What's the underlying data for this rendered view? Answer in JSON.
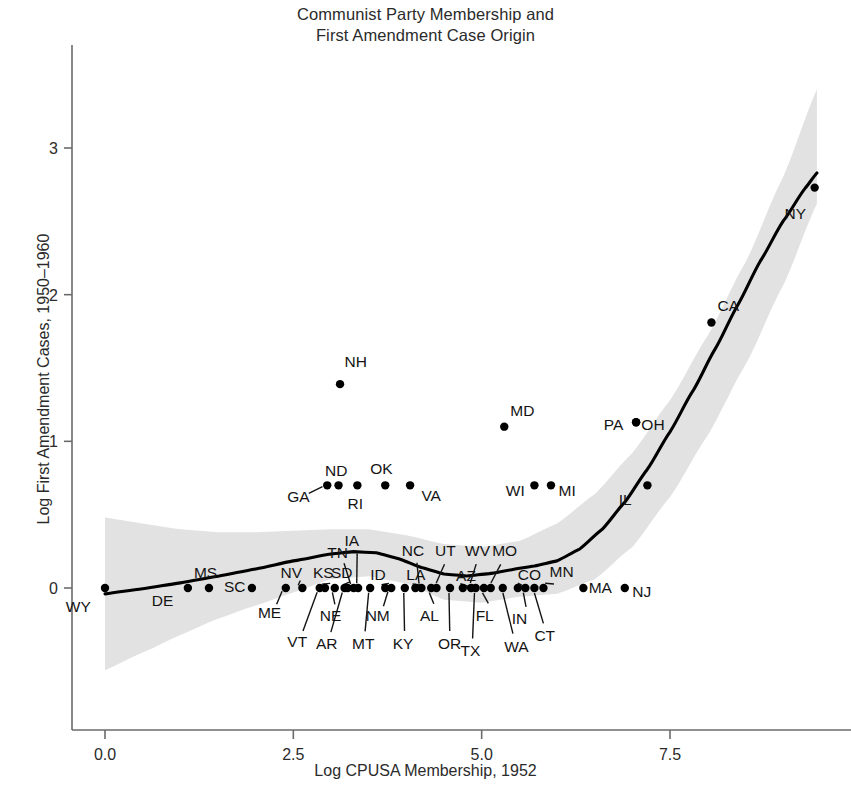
{
  "title": {
    "line1": "Communist Party Membership and",
    "line2": "First Amendment Case Origin"
  },
  "axes": {
    "x_label": "Log CPUSA Membership, 1952",
    "y_label": "Log First Amendment Cases, 1950–1960",
    "x_ticks": [
      "0.0",
      "2.5",
      "5.0",
      "7.5"
    ],
    "y_ticks": [
      "0",
      "1",
      "2",
      "3"
    ]
  },
  "colors": {
    "line": "#000000",
    "band": "#e2e2e2",
    "point": "#000000",
    "axis": "#6b6b6b",
    "text": "#2b2b2b"
  },
  "chart_data": {
    "type": "scatter",
    "title": "Communist Party Membership and First Amendment Case Origin",
    "xlabel": "Log CPUSA Membership, 1952",
    "ylabel": "Log First Amendment Cases, 1950–1960",
    "xlim": [
      -0.45,
      9.9
    ],
    "ylim": [
      -0.55,
      3.5
    ],
    "x_ticks": [
      0.0,
      2.5,
      5.0,
      7.5
    ],
    "y_ticks": [
      0,
      1,
      2,
      3
    ],
    "grid": false,
    "legend": "none",
    "point_label_field": "state",
    "annotations": [
      "LOESS smoother with shaded 95% confidence band"
    ],
    "points": [
      {
        "state": "WY",
        "x": 0.0,
        "y": 0.0,
        "lx": -0.52,
        "ly": -0.13,
        "anchor": "start"
      },
      {
        "state": "DE",
        "x": 1.1,
        "y": 0.0,
        "lx": 0.62,
        "ly": -0.09,
        "anchor": "start"
      },
      {
        "state": "MS",
        "x": 1.38,
        "y": 0.0,
        "lx": 1.18,
        "ly": 0.1,
        "anchor": "start"
      },
      {
        "state": "SC",
        "x": 1.95,
        "y": 0.0,
        "lx": 1.58,
        "ly": 0.01,
        "anchor": "start"
      },
      {
        "state": "ME",
        "x": 2.4,
        "y": 0.0,
        "lx": 2.03,
        "ly": -0.17,
        "anchor": "start",
        "leader": true
      },
      {
        "state": "NV",
        "x": 2.62,
        "y": 0.0,
        "lx": 2.33,
        "ly": 0.1,
        "anchor": "start",
        "leader": true
      },
      {
        "state": "VT",
        "x": 2.85,
        "y": 0.0,
        "lx": 2.42,
        "ly": -0.37,
        "anchor": "start",
        "leader": true
      },
      {
        "state": "KS",
        "x": 2.92,
        "y": 0.0,
        "lx": 2.76,
        "ly": 0.1,
        "anchor": "start",
        "leader": true
      },
      {
        "state": "NE",
        "x": 3.05,
        "y": 0.0,
        "lx": 2.85,
        "ly": -0.19,
        "anchor": "start",
        "leader": true
      },
      {
        "state": "AR",
        "x": 3.18,
        "y": 0.0,
        "lx": 2.8,
        "ly": -0.38,
        "anchor": "start",
        "leader": true
      },
      {
        "state": "SD",
        "x": 3.22,
        "y": 0.0,
        "lx": 3.0,
        "ly": 0.1,
        "anchor": "start",
        "leader": true
      },
      {
        "state": "TN",
        "x": 3.3,
        "y": 0.0,
        "lx": 2.95,
        "ly": 0.24,
        "anchor": "start",
        "leader": true
      },
      {
        "state": "IA",
        "x": 3.36,
        "y": 0.0,
        "lx": 3.18,
        "ly": 0.32,
        "anchor": "start",
        "leader": true
      },
      {
        "state": "MT",
        "x": 3.52,
        "y": 0.0,
        "lx": 3.28,
        "ly": -0.38,
        "anchor": "start",
        "leader": true
      },
      {
        "state": "ID",
        "x": 3.72,
        "y": 0.0,
        "lx": 3.52,
        "ly": 0.09,
        "anchor": "start",
        "leader": true
      },
      {
        "state": "NM",
        "x": 3.8,
        "y": 0.0,
        "lx": 3.46,
        "ly": -0.19,
        "anchor": "start",
        "leader": true
      },
      {
        "state": "KY",
        "x": 3.98,
        "y": 0.0,
        "lx": 3.82,
        "ly": -0.38,
        "anchor": "start",
        "leader": true
      },
      {
        "state": "LA",
        "x": 4.12,
        "y": 0.0,
        "lx": 4.0,
        "ly": 0.09,
        "anchor": "start",
        "leader": true
      },
      {
        "state": "NC",
        "x": 4.2,
        "y": 0.0,
        "lx": 3.94,
        "ly": 0.25,
        "anchor": "start",
        "leader": true
      },
      {
        "state": "AL",
        "x": 4.33,
        "y": 0.0,
        "lx": 4.18,
        "ly": -0.19,
        "anchor": "start",
        "leader": true
      },
      {
        "state": "UT",
        "x": 4.4,
        "y": 0.0,
        "lx": 4.38,
        "ly": 0.25,
        "anchor": "start",
        "leader": true
      },
      {
        "state": "OR",
        "x": 4.58,
        "y": 0.0,
        "lx": 4.42,
        "ly": -0.38,
        "anchor": "start",
        "leader": true
      },
      {
        "state": "AZ",
        "x": 4.75,
        "y": 0.0,
        "lx": 4.66,
        "ly": 0.08,
        "anchor": "start",
        "leader": true
      },
      {
        "state": "WV",
        "x": 4.86,
        "y": 0.0,
        "lx": 4.78,
        "ly": 0.25,
        "anchor": "start",
        "leader": true
      },
      {
        "state": "TX",
        "x": 4.92,
        "y": 0.0,
        "lx": 4.72,
        "ly": -0.43,
        "anchor": "start",
        "leader": true
      },
      {
        "state": "FL",
        "x": 5.03,
        "y": 0.0,
        "lx": 4.92,
        "ly": -0.19,
        "anchor": "start",
        "leader": true
      },
      {
        "state": "MO",
        "x": 5.12,
        "y": 0.0,
        "lx": 5.14,
        "ly": 0.25,
        "anchor": "start",
        "leader": true
      },
      {
        "state": "WA",
        "x": 5.28,
        "y": 0.0,
        "lx": 5.3,
        "ly": -0.4,
        "anchor": "start",
        "leader": true
      },
      {
        "state": "CO",
        "x": 5.48,
        "y": 0.0,
        "lx": 5.48,
        "ly": 0.09,
        "anchor": "start",
        "leader": true
      },
      {
        "state": "IN",
        "x": 5.58,
        "y": 0.0,
        "lx": 5.4,
        "ly": -0.21,
        "anchor": "start",
        "leader": true
      },
      {
        "state": "CT",
        "x": 5.7,
        "y": 0.0,
        "lx": 5.7,
        "ly": -0.33,
        "anchor": "start",
        "leader": true
      },
      {
        "state": "MN",
        "x": 5.82,
        "y": 0.0,
        "lx": 5.9,
        "ly": 0.11,
        "anchor": "start",
        "leader": true
      },
      {
        "state": "MA",
        "x": 6.35,
        "y": 0.0,
        "lx": 6.42,
        "ly": 0.0,
        "anchor": "start"
      },
      {
        "state": "NJ",
        "x": 6.9,
        "y": 0.0,
        "lx": 7.0,
        "ly": -0.03,
        "anchor": "start"
      },
      {
        "state": "GA",
        "x": 2.95,
        "y": 0.7,
        "lx": 2.42,
        "ly": 0.62,
        "anchor": "start",
        "leader": true
      },
      {
        "state": "ND",
        "x": 3.1,
        "y": 0.7,
        "lx": 2.92,
        "ly": 0.8,
        "anchor": "start"
      },
      {
        "state": "RI",
        "x": 3.35,
        "y": 0.7,
        "lx": 3.22,
        "ly": 0.57,
        "anchor": "start"
      },
      {
        "state": "OK",
        "x": 3.72,
        "y": 0.7,
        "lx": 3.52,
        "ly": 0.81,
        "anchor": "start"
      },
      {
        "state": "VA",
        "x": 4.05,
        "y": 0.7,
        "lx": 4.2,
        "ly": 0.63,
        "anchor": "start"
      },
      {
        "state": "WI",
        "x": 5.7,
        "y": 0.7,
        "lx": 5.32,
        "ly": 0.66,
        "anchor": "start"
      },
      {
        "state": "MI",
        "x": 5.92,
        "y": 0.7,
        "lx": 6.02,
        "ly": 0.66,
        "anchor": "start"
      },
      {
        "state": "IL",
        "x": 7.2,
        "y": 0.7,
        "lx": 6.82,
        "ly": 0.6,
        "anchor": "start"
      },
      {
        "state": "MD",
        "x": 5.3,
        "y": 1.1,
        "lx": 5.38,
        "ly": 1.21,
        "anchor": "start"
      },
      {
        "state": "PA",
        "x": 7.05,
        "y": 1.13,
        "lx": 6.62,
        "ly": 1.11,
        "anchor": "start"
      },
      {
        "state": "OH",
        "x": 7.05,
        "y": 1.13,
        "lx": 7.12,
        "ly": 1.11,
        "anchor": "start"
      },
      {
        "state": "NH",
        "x": 3.12,
        "y": 1.39,
        "lx": 3.18,
        "ly": 1.54,
        "anchor": "start"
      },
      {
        "state": "CA",
        "x": 8.05,
        "y": 1.81,
        "lx": 8.13,
        "ly": 1.92,
        "anchor": "start"
      },
      {
        "state": "NY",
        "x": 9.42,
        "y": 2.73,
        "lx": 9.02,
        "ly": 2.55,
        "anchor": "start"
      }
    ],
    "fit_line": [
      {
        "x": 0.0,
        "y": -0.04
      },
      {
        "x": 0.5,
        "y": -0.005
      },
      {
        "x": 1.0,
        "y": 0.035
      },
      {
        "x": 1.5,
        "y": 0.08
      },
      {
        "x": 2.0,
        "y": 0.13
      },
      {
        "x": 2.5,
        "y": 0.185
      },
      {
        "x": 3.0,
        "y": 0.232
      },
      {
        "x": 3.3,
        "y": 0.248
      },
      {
        "x": 3.6,
        "y": 0.24
      },
      {
        "x": 3.9,
        "y": 0.2
      },
      {
        "x": 4.2,
        "y": 0.14
      },
      {
        "x": 4.5,
        "y": 0.095
      },
      {
        "x": 4.8,
        "y": 0.082
      },
      {
        "x": 5.1,
        "y": 0.098
      },
      {
        "x": 5.4,
        "y": 0.125
      },
      {
        "x": 5.7,
        "y": 0.15
      },
      {
        "x": 6.0,
        "y": 0.185
      },
      {
        "x": 6.3,
        "y": 0.265
      },
      {
        "x": 6.6,
        "y": 0.4
      },
      {
        "x": 6.9,
        "y": 0.585
      },
      {
        "x": 7.2,
        "y": 0.81
      },
      {
        "x": 7.5,
        "y": 1.065
      },
      {
        "x": 7.8,
        "y": 1.34
      },
      {
        "x": 8.1,
        "y": 1.63
      },
      {
        "x": 8.4,
        "y": 1.93
      },
      {
        "x": 8.7,
        "y": 2.23
      },
      {
        "x": 9.0,
        "y": 2.5
      },
      {
        "x": 9.3,
        "y": 2.73
      },
      {
        "x": 9.45,
        "y": 2.83
      }
    ],
    "band_upper": [
      {
        "x": 0.0,
        "y": 0.48
      },
      {
        "x": 0.5,
        "y": 0.44
      },
      {
        "x": 1.0,
        "y": 0.4
      },
      {
        "x": 1.5,
        "y": 0.38
      },
      {
        "x": 2.0,
        "y": 0.38
      },
      {
        "x": 2.5,
        "y": 0.39
      },
      {
        "x": 3.0,
        "y": 0.4
      },
      {
        "x": 3.5,
        "y": 0.4
      },
      {
        "x": 4.0,
        "y": 0.36
      },
      {
        "x": 4.5,
        "y": 0.3
      },
      {
        "x": 5.0,
        "y": 0.28
      },
      {
        "x": 5.5,
        "y": 0.32
      },
      {
        "x": 6.0,
        "y": 0.44
      },
      {
        "x": 6.5,
        "y": 0.64
      },
      {
        "x": 7.0,
        "y": 0.92
      },
      {
        "x": 7.5,
        "y": 1.28
      },
      {
        "x": 8.0,
        "y": 1.72
      },
      {
        "x": 8.5,
        "y": 2.22
      },
      {
        "x": 9.0,
        "y": 2.8
      },
      {
        "x": 9.45,
        "y": 3.4
      }
    ],
    "band_lower": [
      {
        "x": 0.0,
        "y": -0.56
      },
      {
        "x": 0.5,
        "y": -0.44
      },
      {
        "x": 1.0,
        "y": -0.32
      },
      {
        "x": 1.5,
        "y": -0.21
      },
      {
        "x": 2.0,
        "y": -0.12
      },
      {
        "x": 2.5,
        "y": -0.03
      },
      {
        "x": 3.0,
        "y": 0.06
      },
      {
        "x": 3.5,
        "y": 0.08
      },
      {
        "x": 4.0,
        "y": 0.03
      },
      {
        "x": 4.5,
        "y": -0.08
      },
      {
        "x": 5.0,
        "y": -0.1
      },
      {
        "x": 5.5,
        "y": -0.06
      },
      {
        "x": 6.0,
        "y": -0.04
      },
      {
        "x": 6.5,
        "y": 0.06
      },
      {
        "x": 7.0,
        "y": 0.28
      },
      {
        "x": 7.5,
        "y": 0.62
      },
      {
        "x": 8.0,
        "y": 1.04
      },
      {
        "x": 8.5,
        "y": 1.52
      },
      {
        "x": 9.0,
        "y": 2.06
      },
      {
        "x": 9.45,
        "y": 2.62
      }
    ]
  }
}
